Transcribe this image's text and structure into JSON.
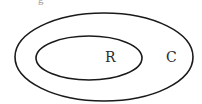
{
  "diagram": {
    "type": "nested-sets",
    "top_text_fragment": "g",
    "sets": [
      {
        "label": "C",
        "role": "outer"
      },
      {
        "label": "R",
        "role": "inner"
      }
    ],
    "stroke_color": "#1a1a1a"
  }
}
